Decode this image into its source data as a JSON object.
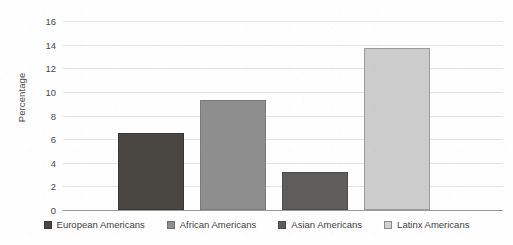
{
  "chart_data": {
    "type": "bar",
    "title": "",
    "xlabel": "",
    "ylabel": "Percentage",
    "ylim": [
      0,
      16
    ],
    "ytick_step": 2,
    "yticks": [
      "16",
      "14",
      "12",
      "10",
      "8",
      "6",
      "4",
      "2",
      "0"
    ],
    "grid": true,
    "legend_position": "bottom",
    "categories": [
      "European Americans",
      "African Americans",
      "Asian Americans",
      "Latinx Americans"
    ],
    "values": [
      6.5,
      9.35,
      3.2,
      13.7
    ],
    "series": [
      {
        "name": "Percentage",
        "values": [
          6.5,
          9.35,
          3.2,
          13.7
        ]
      }
    ],
    "bars": [
      {
        "label": "European Americans",
        "value": 6.5,
        "color": "#4a4743",
        "border": "#3a3835"
      },
      {
        "label": "African Americans",
        "value": 9.35,
        "color": "#8e8e8e",
        "border": "#7a7a7a"
      },
      {
        "label": "Asian Americans",
        "value": 3.2,
        "color": "#5f5d5b",
        "border": "#4e4c4a"
      },
      {
        "label": "Latinx Americans",
        "value": 13.7,
        "color": "#cccccc",
        "border": "#9b9b9b"
      }
    ]
  },
  "legend": {
    "items": [
      {
        "label": "European Americans",
        "color": "#4a4743",
        "border": "#3a3835"
      },
      {
        "label": "African Americans",
        "color": "#8e8e8e",
        "border": "#6f6f6f"
      },
      {
        "label": "Asian Americans",
        "color": "#5f5d5b",
        "border": "#4e4c4a"
      },
      {
        "label": "Latinx Americans",
        "color": "#d2d2d2",
        "border": "#8a8a8a"
      }
    ]
  },
  "axis": {
    "y_title": "Percentage"
  }
}
